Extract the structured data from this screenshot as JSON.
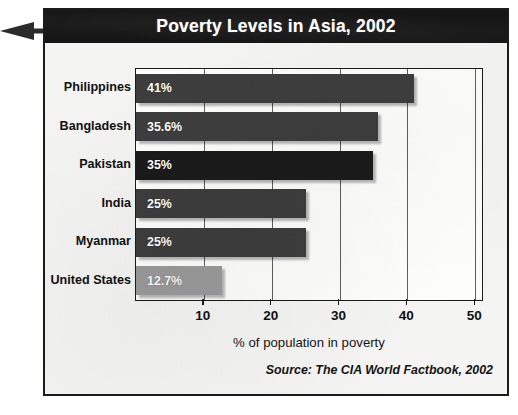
{
  "figure": {
    "title": "Poverty Levels in Asia, 2002",
    "pointer_icon": "arrow-right-icon",
    "source_note": "Source: The CIA World Factbook, 2002",
    "colors": {
      "title_bar_background": "#151515",
      "title_text": "#ffffff",
      "panel_background": "#f4f4f2",
      "plot_background": "#fdfdfc",
      "frame_border": "#1b1b1b",
      "bar_dark": "#3d3d3d",
      "bar_darkest": "#1a1a1a",
      "bar_light": "#9a9a9a",
      "gridline": "#5e5e5e"
    }
  },
  "chart_data": {
    "type": "bar",
    "orientation": "horizontal",
    "title": "Poverty Levels in Asia, 2002",
    "subtitle": "",
    "xlabel": "% of population in poverty",
    "ylabel": "",
    "xlim": [
      0,
      51
    ],
    "xticks": [
      10,
      20,
      30,
      40,
      50
    ],
    "xtick_labels": [
      "10",
      "20",
      "30",
      "40",
      "50"
    ],
    "grid": true,
    "grid_axis": "x",
    "legend": false,
    "legend_position": "none",
    "categories": [
      "Philippines",
      "Bangladesh",
      "Pakistan",
      "India",
      "Myanmar",
      "United States"
    ],
    "values": [
      41,
      35.6,
      35,
      25,
      25,
      12.7
    ],
    "data_labels": [
      "41%",
      "35.6%",
      "35%",
      "25%",
      "25%",
      "12.7%"
    ],
    "bar_colors": [
      "#3d3d3d",
      "#3d3d3d",
      "#1a1a1a",
      "#3d3d3d",
      "#3d3d3d",
      "#9a9a9a"
    ],
    "annotations": [
      "Source: The CIA World Factbook, 2002"
    ]
  }
}
